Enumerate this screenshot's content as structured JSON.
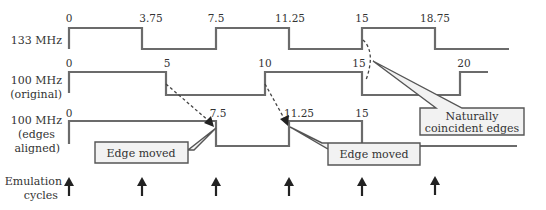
{
  "rows": [
    {
      "label_lines": [
        "133 MHz"
      ],
      "ticks": [
        {
          "x": 69,
          "text": "0"
        },
        {
          "x": 142,
          "text": "3.75"
        },
        {
          "x": 216,
          "text": "7.5"
        },
        {
          "x": 289,
          "text": "11.25"
        },
        {
          "x": 362,
          "text": "15"
        },
        {
          "x": 435,
          "text": "18.75"
        }
      ]
    },
    {
      "label_lines": [
        "100 MHz",
        "(original)"
      ],
      "ticks": [
        {
          "x": 69,
          "text": "0"
        },
        {
          "x": 166,
          "text": "5"
        },
        {
          "x": 265,
          "text": "10"
        },
        {
          "x": 358,
          "text": "15"
        },
        {
          "x": 460,
          "text": "20"
        }
      ]
    },
    {
      "label_lines": [
        "100 MHz",
        "(edges",
        "aligned)"
      ],
      "ticks": [
        {
          "x": 69,
          "text": "0"
        },
        {
          "x": 216,
          "text": "7.5"
        },
        {
          "x": 289,
          "text": "11.25"
        },
        {
          "x": 362,
          "text": "15"
        }
      ]
    }
  ],
  "callouts": {
    "edge_moved_1": "Edge moved",
    "edge_moved_2": "Edge moved",
    "coincident_line1": "Naturally",
    "coincident_line2": "coincident edges"
  },
  "emulation": {
    "label_lines": [
      "Emulation",
      "cycles"
    ],
    "arrow_x": [
      69,
      142,
      216,
      289,
      362,
      435
    ]
  }
}
